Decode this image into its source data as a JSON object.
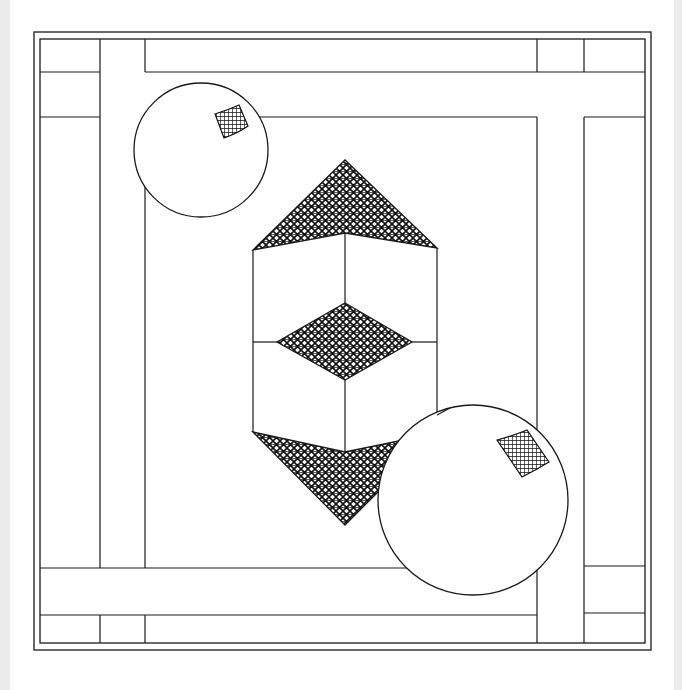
{
  "artwork": {
    "type": "line-drawing",
    "description": "Geometric op-art composition: double-bordered square frame with crossing bands, a hexagonal prism with hatched triangular caps and central hatched diamond, and two spheres with hatched highlight patches",
    "colors": {
      "background": "#ffffff",
      "ink": "#1a1a1a",
      "side_margin": "#ececec"
    },
    "frame": {
      "outer": {
        "x": 34,
        "y": 32,
        "w": 617,
        "h": 618
      },
      "inner": {
        "x": 40,
        "y": 39,
        "w": 605,
        "h": 604
      }
    },
    "bands": {
      "left_vertical": {
        "x1": 100,
        "x2": 145
      },
      "right_vertical": {
        "x1": 537,
        "x2": 584
      },
      "top_lines_y": [
        72,
        117
      ],
      "bottom_lines_y": [
        568,
        615
      ]
    },
    "prism": {
      "top_apex": [
        345,
        160
      ],
      "bottom_apex": [
        345,
        525
      ],
      "left_x": 253,
      "right_x": 437,
      "center_x": 345
    },
    "spheres": [
      {
        "name": "small-sphere",
        "cx": 201,
        "cy": 150,
        "r": 67
      },
      {
        "name": "large-sphere",
        "cx": 473,
        "cy": 500,
        "r": 95
      }
    ]
  }
}
